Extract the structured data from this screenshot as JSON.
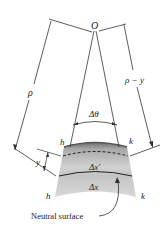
{
  "diagram": {
    "type": "beam-bending-geometry",
    "labels": {
      "center": "O",
      "radius": "ρ",
      "radius_minus_y": "ρ − y",
      "angle": "Δθ",
      "distance_y": "y",
      "section_left_top": "h",
      "section_right_top": "k",
      "section_left_bottom": "h",
      "section_right_bottom": "k",
      "fiber_length_deformed": "Δx′",
      "fiber_length_neutral": "Δx",
      "neutral_surface": "Neutral surface"
    },
    "colors": {
      "line": "#333333",
      "beam_top": "#7a7a7a",
      "beam_mid": "#c8c8c8",
      "beam_bottom": "#d4d4d4",
      "text": "#222222"
    }
  }
}
